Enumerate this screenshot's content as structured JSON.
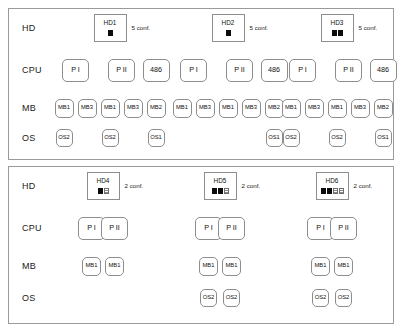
{
  "figure": {
    "panels": [
      {
        "id": "panel-top",
        "row_labels": [
          "HD",
          "CPU",
          "MB",
          "OS"
        ],
        "trees": [
          {
            "hd": {
              "label": "HD1",
              "filled_chips": 1,
              "hollow_chips": 0
            },
            "conf_label": "5 conf.",
            "cpus": [
              {
                "label": "P I",
                "mbs": [
                  {
                    "label": "MB1",
                    "os": "OS2"
                  },
                  {
                    "label": "MB3",
                    "os": null
                  }
                ]
              },
              {
                "label": "P II",
                "mbs": [
                  {
                    "label": "MB1",
                    "os": "OS2"
                  },
                  {
                    "label": "MB3",
                    "os": null
                  }
                ]
              },
              {
                "label": "486",
                "mbs": [
                  {
                    "label": "MB2",
                    "os": "OS1"
                  }
                ]
              }
            ]
          },
          {
            "hd": {
              "label": "HD2",
              "filled_chips": 1,
              "hollow_chips": 0
            },
            "conf_label": "5 conf.",
            "cpus": [
              {
                "label": "P I",
                "mbs": [
                  {
                    "label": "MB1",
                    "os": null
                  },
                  {
                    "label": "MB3",
                    "os": null
                  }
                ]
              },
              {
                "label": "P II",
                "mbs": [
                  {
                    "label": "MB1",
                    "os": null
                  },
                  {
                    "label": "MB3",
                    "os": null
                  }
                ]
              },
              {
                "label": "486",
                "mbs": [
                  {
                    "label": "MB2",
                    "os": "OS1"
                  }
                ]
              }
            ]
          },
          {
            "hd": {
              "label": "HD3",
              "filled_chips": 2,
              "hollow_chips": 0
            },
            "conf_label": "5 conf.",
            "cpus": [
              {
                "label": "P I",
                "mbs": [
                  {
                    "label": "MB1",
                    "os": "OS2"
                  },
                  {
                    "label": "MB3",
                    "os": null
                  }
                ]
              },
              {
                "label": "P II",
                "mbs": [
                  {
                    "label": "MB1",
                    "os": "OS2"
                  },
                  {
                    "label": "MB3",
                    "os": null
                  }
                ]
              },
              {
                "label": "486",
                "mbs": [
                  {
                    "label": "MB2",
                    "os": "OS1"
                  }
                ]
              }
            ]
          }
        ]
      },
      {
        "id": "panel-bottom",
        "row_labels": [
          "HD",
          "CPU",
          "MB",
          "OS"
        ],
        "trees": [
          {
            "hd": {
              "label": "HD4",
              "filled_chips": 1,
              "hollow_chips": 1
            },
            "conf_label": "2 conf.",
            "cpus": [
              {
                "label": "P I",
                "mbs": [
                  {
                    "label": "MB1",
                    "os": null
                  }
                ]
              },
              {
                "label": "P II",
                "mbs": [
                  {
                    "label": "MB1",
                    "os": null
                  }
                ]
              }
            ]
          },
          {
            "hd": {
              "label": "HD5",
              "filled_chips": 2,
              "hollow_chips": 1
            },
            "conf_label": "2 conf.",
            "cpus": [
              {
                "label": "P I",
                "mbs": [
                  {
                    "label": "MB1",
                    "os": "OS2"
                  }
                ]
              },
              {
                "label": "P II",
                "mbs": [
                  {
                    "label": "MB1",
                    "os": "OS2"
                  }
                ]
              }
            ]
          },
          {
            "hd": {
              "label": "HD6",
              "filled_chips": 2,
              "hollow_chips": 2
            },
            "conf_label": "2 conf.",
            "cpus": [
              {
                "label": "P I",
                "mbs": [
                  {
                    "label": "MB1",
                    "os": "OS2"
                  }
                ]
              },
              {
                "label": "P II",
                "mbs": [
                  {
                    "label": "MB1",
                    "os": "OS2"
                  }
                ]
              }
            ]
          }
        ]
      }
    ]
  },
  "colors": {
    "stroke": "#8d8d8d",
    "panel_border": "#9a9a9a",
    "chip_filled": "#0c0c0c",
    "text": "#111111",
    "background": "#ffffff"
  }
}
